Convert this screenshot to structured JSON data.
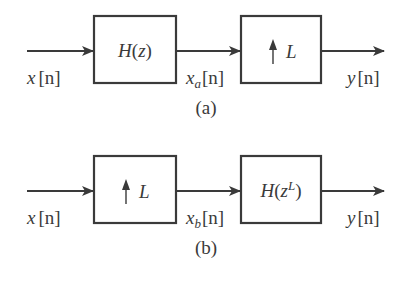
{
  "diagrams": [
    {
      "id": "a",
      "caption": "(a)",
      "input_label": {
        "var": "x",
        "idx": "[n]"
      },
      "block1": {
        "kind": "filter",
        "text_main": "H(z)",
        "text_sup": ""
      },
      "mid_label": {
        "var": "x",
        "sub": "a",
        "idx": "[n]"
      },
      "block2": {
        "kind": "upsampler",
        "arrow": "↑",
        "text": "L"
      },
      "output_label": {
        "var": "y",
        "idx": "[n]"
      }
    },
    {
      "id": "b",
      "caption": "(b)",
      "input_label": {
        "var": "x",
        "idx": "[n]"
      },
      "block1": {
        "kind": "upsampler",
        "arrow": "↑",
        "text": "L"
      },
      "mid_label": {
        "var": "x",
        "sub": "b",
        "idx": "[n]"
      },
      "block2": {
        "kind": "filter",
        "text_main": "H(z",
        "text_sup": "L",
        "text_close": ")"
      },
      "output_label": {
        "var": "y",
        "idx": "[n]"
      }
    }
  ],
  "colors": {
    "stroke": "#3a3a3a",
    "background": "#ffffff"
  }
}
